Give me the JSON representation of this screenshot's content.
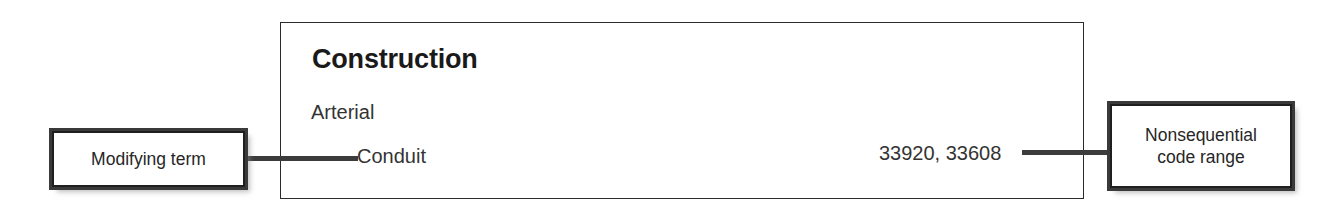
{
  "figure": {
    "type": "annotated-index-entry-diagram",
    "background_color": "#ffffff"
  },
  "entry": {
    "main_term": "Construction",
    "subterm": "Arterial",
    "modifying_term": "Conduit",
    "code_range": "33920, 33608",
    "border_color": "#2b2b2b",
    "text_color": "#333333",
    "title_color": "#1a1a1a"
  },
  "callouts": [
    {
      "id": "modifying-term",
      "label": "Modifying term",
      "side": "left",
      "border_color": "#1f1f1f",
      "background_color": "#ffffff"
    },
    {
      "id": "nonsequential-code-range",
      "label_line_1": "Nonsequential",
      "label_line_2": "code range",
      "label": "Nonsequential code range",
      "side": "right",
      "border_color": "#1f1f1f",
      "background_color": "#ffffff"
    }
  ],
  "leaders": {
    "left_line_color": "#3c3c3c",
    "right_line_color": "#3c3c3c"
  }
}
